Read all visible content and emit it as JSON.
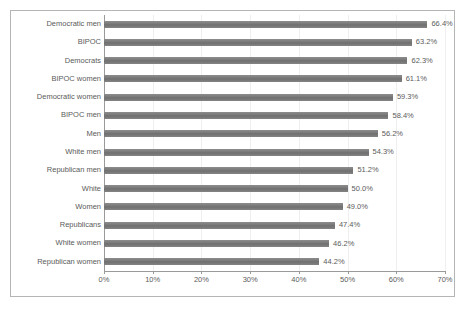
{
  "chart_data": {
    "type": "bar",
    "orientation": "horizontal",
    "title": "",
    "subtitle": "",
    "xlabel": "",
    "ylabel": "",
    "xlim": [
      0,
      70
    ],
    "grid": true,
    "legend": false,
    "legend_position": "none",
    "bar_color": "#7a7a7a",
    "text_color": "#5b5b5b",
    "axis_color": "#9a9a9a",
    "gridline_color": "#efefef",
    "border_color": "#b5b5b5",
    "xticks": [
      "0%",
      "10%",
      "20%",
      "30%",
      "40%",
      "50%",
      "60%",
      "70%"
    ],
    "xtick_values": [
      0,
      10,
      20,
      30,
      40,
      50,
      60,
      70
    ],
    "categories": [
      "Democratic men",
      "BIPOC",
      "Democrats",
      "BIPOC women",
      "Democratic women",
      "BIPOC men",
      "Men",
      "White men",
      "Republican men",
      "White",
      "Women",
      "Republicans",
      "White women",
      "Republican women"
    ],
    "values": [
      66.4,
      63.2,
      62.3,
      61.1,
      59.3,
      58.4,
      56.2,
      54.3,
      51.2,
      50.0,
      49.0,
      47.4,
      46.2,
      44.2
    ],
    "data_labels": [
      "66.4%",
      "63.2%",
      "62.3%",
      "61.1%",
      "59.3%",
      "58.4%",
      "56.2%",
      "54.3%",
      "51.2%",
      "50.0%",
      "49.0%",
      "47.4%",
      "46.2%",
      "44.2%"
    ]
  }
}
